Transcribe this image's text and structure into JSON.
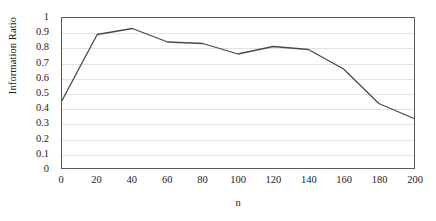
{
  "chart_data": {
    "type": "line",
    "title": "",
    "xlabel": "n",
    "ylabel": "Information Ratio",
    "x": [
      0,
      20,
      40,
      60,
      80,
      100,
      120,
      140,
      160,
      180,
      200
    ],
    "values": [
      0.45,
      0.89,
      0.93,
      0.84,
      0.83,
      0.76,
      0.81,
      0.79,
      0.66,
      0.43,
      0.33
    ],
    "series": [
      {
        "name": "Information Ratio",
        "values": [
          0.45,
          0.89,
          0.93,
          0.84,
          0.83,
          0.76,
          0.81,
          0.79,
          0.66,
          0.43,
          0.33
        ]
      }
    ],
    "xlim": [
      0,
      200
    ],
    "ylim": [
      0,
      1
    ],
    "x_ticks": [
      "0",
      "20",
      "40",
      "60",
      "80",
      "100",
      "120",
      "140",
      "160",
      "180",
      "200"
    ],
    "y_ticks": [
      "0",
      "0.1",
      "0.2",
      "0.3",
      "0.4",
      "0.5",
      "0.6",
      "0.7",
      "0.8",
      "0.9",
      "1"
    ],
    "y_tick_values": [
      0,
      0.1,
      0.2,
      0.3,
      0.4,
      0.5,
      0.6,
      0.7,
      0.8,
      0.9,
      1
    ],
    "grid": "horizontal",
    "legend": "none",
    "line_color": "#4a4a4a",
    "grid_color": "#e2e2e2",
    "frame_color": "#5a5a5a",
    "background_color": "#ffffff"
  }
}
